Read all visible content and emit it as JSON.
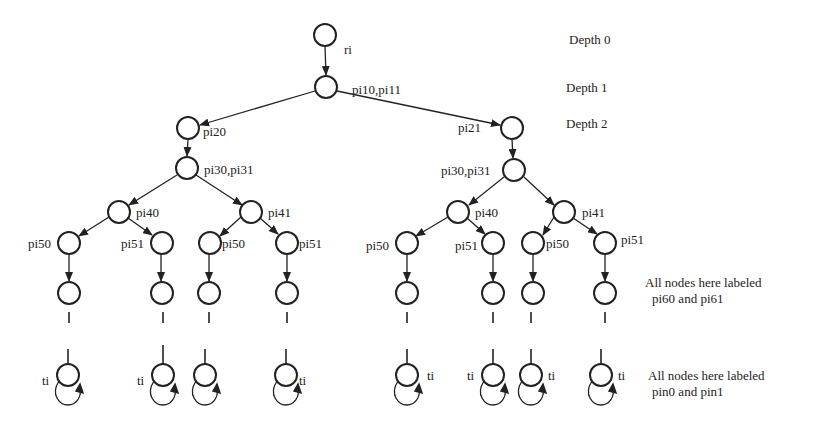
{
  "diagram": {
    "type": "tree",
    "depth_labels": [
      "Depth 0",
      "Depth 1",
      "Depth 2"
    ],
    "annotations": {
      "level6_line1": "All nodes here labeled",
      "level6_line2": "pi60 and pi61",
      "bottom_line1": "All nodes here labeled",
      "bottom_line2": "pin0 and pin1"
    },
    "node_labels": {
      "root": "ri",
      "depth1": "pi10,pi11",
      "left_d2": "pi20",
      "right_d2": "pi21",
      "d3": "pi30,pi31",
      "d4_left": "pi40",
      "d4_right": "pi41",
      "d5_left": "pi50",
      "d5_right": "pi51",
      "terminal": "ti"
    },
    "colors": {
      "stroke": "#222222",
      "background": "#ffffff"
    }
  }
}
